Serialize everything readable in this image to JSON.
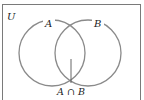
{
  "diagram": {
    "type": "venn",
    "universe_label": "U",
    "sets": [
      {
        "label": "A",
        "cx": 52,
        "cy": 53,
        "r": 33
      },
      {
        "label": "B",
        "cx": 88,
        "cy": 53,
        "r": 33
      }
    ],
    "intersection_label": "A ∩ B",
    "colors": {
      "frame": "#7a7a7a",
      "circle": "#8a8a8a",
      "text": "#222222",
      "background": "#ffffff"
    }
  }
}
